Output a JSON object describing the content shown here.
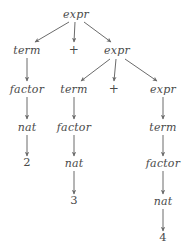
{
  "figure": {
    "background_color": "#ffffff",
    "text_color": "#4a4a4a",
    "edge_color": "#6b6b6b",
    "width": 184,
    "height": 250
  },
  "nodes": [
    {
      "id": "n0",
      "label": "expr",
      "kind": "nonterminal",
      "x": 76,
      "y": 14
    },
    {
      "id": "n1",
      "label": "term",
      "kind": "nonterminal",
      "x": 27,
      "y": 50
    },
    {
      "id": "n2",
      "label": "+",
      "kind": "operator",
      "x": 74,
      "y": 50
    },
    {
      "id": "n3",
      "label": "expr",
      "kind": "nonterminal",
      "x": 117,
      "y": 50
    },
    {
      "id": "n4",
      "label": "factor",
      "kind": "nonterminal",
      "x": 27,
      "y": 89
    },
    {
      "id": "n5",
      "label": "term",
      "kind": "nonterminal",
      "x": 74,
      "y": 89
    },
    {
      "id": "n6",
      "label": "+",
      "kind": "operator",
      "x": 114,
      "y": 89
    },
    {
      "id": "n7",
      "label": "expr",
      "kind": "nonterminal",
      "x": 163,
      "y": 89
    },
    {
      "id": "n8",
      "label": "nat",
      "kind": "nonterminal",
      "x": 27,
      "y": 127
    },
    {
      "id": "n9",
      "label": "factor",
      "kind": "nonterminal",
      "x": 74,
      "y": 127
    },
    {
      "id": "n10",
      "label": "term",
      "kind": "nonterminal",
      "x": 163,
      "y": 127
    },
    {
      "id": "n11",
      "label": "2",
      "kind": "terminal",
      "x": 27,
      "y": 163
    },
    {
      "id": "n12",
      "label": "nat",
      "kind": "nonterminal",
      "x": 74,
      "y": 163
    },
    {
      "id": "n13",
      "label": "factor",
      "kind": "nonterminal",
      "x": 163,
      "y": 163
    },
    {
      "id": "n14",
      "label": "3",
      "kind": "terminal",
      "x": 74,
      "y": 201
    },
    {
      "id": "n15",
      "label": "nat",
      "kind": "nonterminal",
      "x": 163,
      "y": 201
    },
    {
      "id": "n16",
      "label": "4",
      "kind": "terminal",
      "x": 163,
      "y": 238
    }
  ],
  "edges": [
    {
      "from": "n0",
      "to": "n1",
      "x1": 69,
      "y1": 22,
      "x2": 35,
      "y2": 42
    },
    {
      "from": "n0",
      "to": "n2",
      "x1": 75,
      "y1": 22,
      "x2": 74,
      "y2": 42
    },
    {
      "from": "n0",
      "to": "n3",
      "x1": 84,
      "y1": 22,
      "x2": 111,
      "y2": 42
    },
    {
      "from": "n1",
      "to": "n4",
      "x1": 27,
      "y1": 58,
      "x2": 27,
      "y2": 81
    },
    {
      "from": "n3",
      "to": "n5",
      "x1": 110,
      "y1": 59,
      "x2": 81,
      "y2": 81
    },
    {
      "from": "n3",
      "to": "n6",
      "x1": 116,
      "y1": 59,
      "x2": 114,
      "y2": 81
    },
    {
      "from": "n3",
      "to": "n7",
      "x1": 125,
      "y1": 59,
      "x2": 157,
      "y2": 81
    },
    {
      "from": "n4",
      "to": "n8",
      "x1": 27,
      "y1": 97,
      "x2": 27,
      "y2": 119
    },
    {
      "from": "n5",
      "to": "n9",
      "x1": 74,
      "y1": 97,
      "x2": 74,
      "y2": 119
    },
    {
      "from": "n7",
      "to": "n10",
      "x1": 163,
      "y1": 97,
      "x2": 163,
      "y2": 119
    },
    {
      "from": "n8",
      "to": "n11",
      "x1": 27,
      "y1": 135,
      "x2": 27,
      "y2": 156
    },
    {
      "from": "n9",
      "to": "n12",
      "x1": 74,
      "y1": 135,
      "x2": 74,
      "y2": 156
    },
    {
      "from": "n10",
      "to": "n13",
      "x1": 163,
      "y1": 135,
      "x2": 163,
      "y2": 156
    },
    {
      "from": "n12",
      "to": "n14",
      "x1": 74,
      "y1": 171,
      "x2": 74,
      "y2": 194
    },
    {
      "from": "n13",
      "to": "n15",
      "x1": 163,
      "y1": 171,
      "x2": 163,
      "y2": 194
    },
    {
      "from": "n15",
      "to": "n16",
      "x1": 163,
      "y1": 209,
      "x2": 163,
      "y2": 231
    }
  ]
}
